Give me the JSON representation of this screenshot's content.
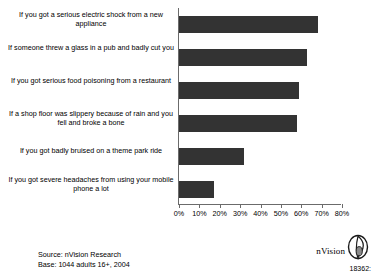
{
  "chart_data": {
    "type": "bar",
    "orientation": "horizontal",
    "title": "",
    "xlabel": "",
    "ylabel": "",
    "grid": false,
    "legend": "none",
    "xlim": [
      0,
      80
    ],
    "categories": [
      "If you got a serious electric shock from a new appliance",
      "If someone threw a glass in a pub and badly cut you",
      "If you got serious food poisoning from a restaurant",
      "If a shop floor was slippery because of rain and you fell and broke a bone",
      "If you got badly bruised on a theme park ride",
      "If you got severe headaches from using your mobile phone a lot"
    ],
    "values": [
      68,
      63,
      59,
      58,
      32,
      17
    ],
    "tick_labels": [
      "0%",
      "10%",
      "20%",
      "30%",
      "40%",
      "50%",
      "60%",
      "70%",
      "80%"
    ],
    "tick_values": [
      0,
      10,
      20,
      30,
      40,
      50,
      60,
      70,
      80
    ],
    "bar_color": "#333333",
    "axis_color": "#6b6b6b"
  },
  "footer": {
    "source": "Source: nVision Research",
    "base": "Base: 1044 adults 16+, 2004",
    "doc_code": "18362:"
  },
  "logo": {
    "wordmark": "nVision",
    "mark_name": "nvision-leaf-logo"
  }
}
